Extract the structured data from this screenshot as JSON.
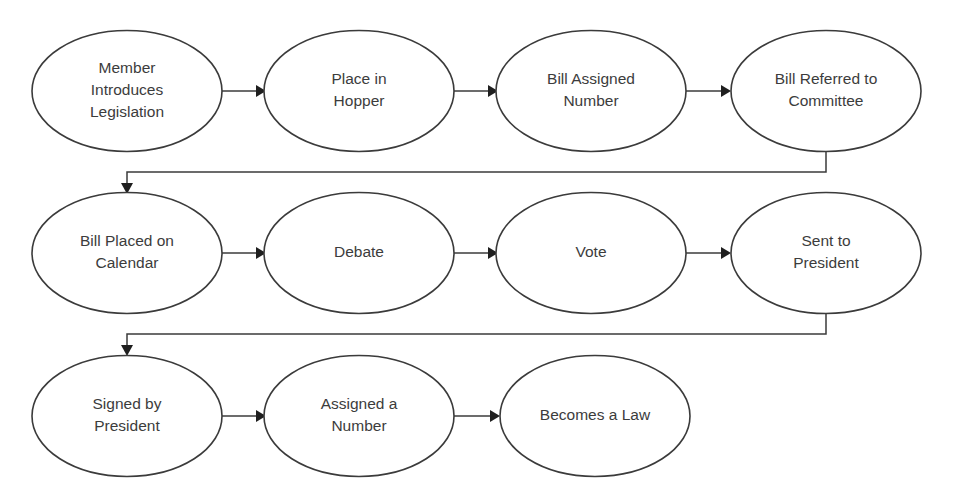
{
  "diagram": {
    "canvas": {
      "width": 954,
      "height": 498,
      "background": "#ffffff"
    },
    "style": {
      "node_stroke": "#3b3b3b",
      "node_fill": "#ffffff",
      "text_color": "#3c3c3c",
      "connector_color": "#3b3b3b",
      "arrow_color": "#1f1f1f"
    },
    "rows": [
      {
        "row_index": 1,
        "nodes": [
          {
            "id": "n1",
            "lines": [
              "Member",
              "Introduces",
              "Legislation"
            ],
            "text": "Member Introduces Legislation",
            "cx": 127,
            "cy": 91
          },
          {
            "id": "n2",
            "lines": [
              "Place in",
              "Hopper"
            ],
            "text": "Place in Hopper",
            "cx": 359,
            "cy": 91
          },
          {
            "id": "n3",
            "lines": [
              "Bill Assigned",
              "Number"
            ],
            "text": "Bill Assigned Number",
            "cx": 591,
            "cy": 91
          },
          {
            "id": "n4",
            "lines": [
              "Bill Referred to",
              "Committee"
            ],
            "text": "Bill Referred to Committee",
            "cx": 826,
            "cy": 91
          }
        ]
      },
      {
        "row_index": 2,
        "nodes": [
          {
            "id": "n5",
            "lines": [
              "Bill Placed on",
              "Calendar"
            ],
            "text": "Bill Placed on Calendar",
            "cx": 127,
            "cy": 253
          },
          {
            "id": "n6",
            "lines": [
              "Debate"
            ],
            "text": "Debate",
            "cx": 359,
            "cy": 253
          },
          {
            "id": "n7",
            "lines": [
              "Vote"
            ],
            "text": "Vote",
            "cx": 591,
            "cy": 253
          },
          {
            "id": "n8",
            "lines": [
              "Sent to",
              "President"
            ],
            "text": "Sent to President",
            "cx": 826,
            "cy": 253
          }
        ]
      },
      {
        "row_index": 3,
        "nodes": [
          {
            "id": "n9",
            "lines": [
              "Signed by",
              "President"
            ],
            "text": "Signed by President",
            "cx": 127,
            "cy": 416
          },
          {
            "id": "n10",
            "lines": [
              "Assigned a",
              "Number"
            ],
            "text": "Assigned a Number",
            "cx": 359,
            "cy": 416
          },
          {
            "id": "n11",
            "lines": [
              "Becomes a Law"
            ],
            "text": "Becomes a Law",
            "cx": 595,
            "cy": 416
          }
        ]
      }
    ],
    "node_size": {
      "rx": 95,
      "ry": 60.5
    },
    "edges": [
      {
        "id": "e1",
        "from": "n1",
        "to": "n2",
        "kind": "straight"
      },
      {
        "id": "e2",
        "from": "n2",
        "to": "n3",
        "kind": "straight"
      },
      {
        "id": "e3",
        "from": "n3",
        "to": "n4",
        "kind": "straight"
      },
      {
        "id": "e4",
        "from": "n4",
        "to": "n5",
        "kind": "elbow"
      },
      {
        "id": "e5",
        "from": "n5",
        "to": "n6",
        "kind": "straight"
      },
      {
        "id": "e6",
        "from": "n6",
        "to": "n7",
        "kind": "straight"
      },
      {
        "id": "e7",
        "from": "n7",
        "to": "n8",
        "kind": "straight"
      },
      {
        "id": "e8",
        "from": "n8",
        "to": "n9",
        "kind": "elbow"
      },
      {
        "id": "e9",
        "from": "n9",
        "to": "n10",
        "kind": "straight"
      },
      {
        "id": "e10",
        "from": "n10",
        "to": "n11",
        "kind": "straight"
      }
    ]
  }
}
